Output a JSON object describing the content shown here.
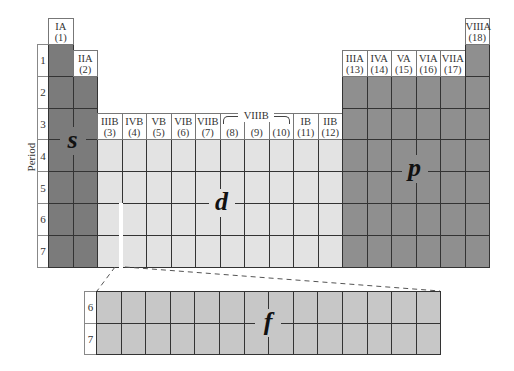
{
  "colors": {
    "s_block": "#7b7b7b",
    "p_block": "#8f8f8f",
    "d_block": "#e3e3e3",
    "f_block": "#c7c7c7",
    "grid": "#2a2a2a"
  },
  "axis_label": "Period",
  "periods": [
    "1",
    "2",
    "3",
    "4",
    "5",
    "6",
    "7"
  ],
  "f_periods": [
    "6",
    "7"
  ],
  "groups": [
    {
      "roman": "IA",
      "num": "(1)"
    },
    {
      "roman": "IIA",
      "num": "(2)"
    },
    {
      "roman": "IIIB",
      "num": "(3)"
    },
    {
      "roman": "IVB",
      "num": "(4)"
    },
    {
      "roman": "VB",
      "num": "(5)"
    },
    {
      "roman": "VIB",
      "num": "(6)"
    },
    {
      "roman": "VIIB",
      "num": "(7)"
    },
    {
      "roman": "",
      "num": "(8)"
    },
    {
      "roman": "",
      "num": "(9)"
    },
    {
      "roman": "",
      "num": "(10)"
    },
    {
      "roman": "IB",
      "num": "(11)"
    },
    {
      "roman": "IIB",
      "num": "(12)"
    },
    {
      "roman": "IIIA",
      "num": "(13)"
    },
    {
      "roman": "IVA",
      "num": "(14)"
    },
    {
      "roman": "VA",
      "num": "(15)"
    },
    {
      "roman": "VIA",
      "num": "(16)"
    },
    {
      "roman": "VIIA",
      "num": "(17)"
    },
    {
      "roman": "VIIIA",
      "num": "(18)"
    }
  ],
  "viiib_label": "VIIIB",
  "blocks": {
    "s": "s",
    "p": "p",
    "d": "d",
    "f": "f"
  }
}
